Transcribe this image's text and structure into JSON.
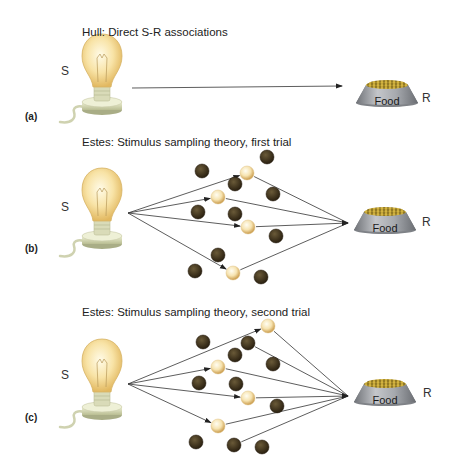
{
  "panels": [
    {
      "id": "a",
      "label": "(a)",
      "title": "Hull: Direct S-R associations",
      "stimulus_label": "S",
      "response_label": "R",
      "food_label": "Food",
      "title_pos": [
        82,
        26
      ],
      "label_pos": [
        25,
        111
      ],
      "s_pos": [
        61,
        65
      ],
      "r_pos": [
        422,
        92
      ],
      "bulb": {
        "cx": 102,
        "cy": 62
      },
      "bowl": {
        "x": 356,
        "y": 81
      },
      "direct_arrow": {
        "from": [
          132,
          88
        ],
        "to": [
          342,
          86
        ]
      }
    },
    {
      "id": "b",
      "label": "(b)",
      "title": "Estes: Stimulus sampling theory, first trial",
      "stimulus_label": "S",
      "response_label": "R",
      "food_label": "Food",
      "title_pos": [
        82,
        136
      ],
      "label_pos": [
        25,
        243
      ],
      "s_pos": [
        61,
        201
      ],
      "r_pos": [
        422,
        216
      ],
      "bulb": {
        "cx": 102,
        "cy": 196
      },
      "bowl": {
        "x": 354,
        "y": 208
      },
      "origin": [
        128,
        213
      ],
      "target": [
        348,
        223
      ],
      "elements": [
        {
          "x": 202,
          "y": 171,
          "sampled": false
        },
        {
          "x": 267,
          "y": 157,
          "sampled": false
        },
        {
          "x": 247,
          "y": 173,
          "sampled": true
        },
        {
          "x": 235,
          "y": 184,
          "sampled": false
        },
        {
          "x": 218,
          "y": 197,
          "sampled": true
        },
        {
          "x": 273,
          "y": 194,
          "sampled": false
        },
        {
          "x": 198,
          "y": 212,
          "sampled": false
        },
        {
          "x": 235,
          "y": 214,
          "sampled": false
        },
        {
          "x": 248,
          "y": 227,
          "sampled": true
        },
        {
          "x": 276,
          "y": 236,
          "sampled": false
        },
        {
          "x": 218,
          "y": 255,
          "sampled": false
        },
        {
          "x": 195,
          "y": 271,
          "sampled": false
        },
        {
          "x": 233,
          "y": 273,
          "sampled": true
        },
        {
          "x": 261,
          "y": 277,
          "sampled": false
        }
      ],
      "connected_to_R": [
        2,
        4,
        8,
        12
      ]
    },
    {
      "id": "c",
      "label": "(c)",
      "title": "Estes: Stimulus sampling theory, second trial",
      "stimulus_label": "S",
      "response_label": "R",
      "food_label": "Food",
      "title_pos": [
        82,
        306
      ],
      "label_pos": [
        25,
        412
      ],
      "s_pos": [
        61,
        369
      ],
      "r_pos": [
        423,
        387
      ],
      "bulb": {
        "cx": 102,
        "cy": 367
      },
      "bowl": {
        "x": 354,
        "y": 380
      },
      "origin": [
        128,
        384
      ],
      "target": [
        348,
        396
      ],
      "elements": [
        {
          "x": 268,
          "y": 326,
          "sampled": true
        },
        {
          "x": 203,
          "y": 342,
          "sampled": false
        },
        {
          "x": 248,
          "y": 343,
          "sampled": false
        },
        {
          "x": 235,
          "y": 355,
          "sampled": false
        },
        {
          "x": 218,
          "y": 367,
          "sampled": true
        },
        {
          "x": 273,
          "y": 364,
          "sampled": false
        },
        {
          "x": 199,
          "y": 383,
          "sampled": false
        },
        {
          "x": 236,
          "y": 384,
          "sampled": false
        },
        {
          "x": 248,
          "y": 398,
          "sampled": true
        },
        {
          "x": 277,
          "y": 406,
          "sampled": false
        },
        {
          "x": 218,
          "y": 426,
          "sampled": true
        },
        {
          "x": 196,
          "y": 442,
          "sampled": false
        },
        {
          "x": 234,
          "y": 445,
          "sampled": false
        },
        {
          "x": 262,
          "y": 447,
          "sampled": false
        }
      ],
      "connected_to_R": [
        0,
        2,
        4,
        8,
        10,
        12
      ]
    }
  ],
  "colors": {
    "line": "#333333",
    "sampled_light": "#fff8e0",
    "sampled_dark": "#d9b062",
    "unsampled_light": "#6a5a38",
    "unsampled_dark": "#2e2414",
    "bulb_glass": "#f6dd9a",
    "bulb_base": "#d8dcb4",
    "bowl": "#8e9196",
    "food_pellets": "#b89a2a"
  }
}
